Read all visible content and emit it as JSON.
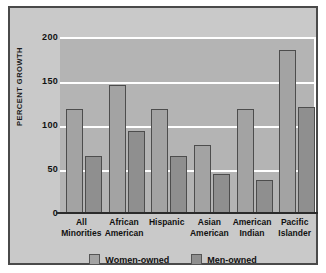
{
  "chart_data": {
    "type": "bar",
    "title": "",
    "subtitle": "",
    "xlabel": "",
    "ylabel": "PERCENT GROWTH",
    "ylim": [
      0,
      200
    ],
    "yticks": [
      0,
      50,
      100,
      150,
      200
    ],
    "grid": true,
    "legend_position": "bottom",
    "categories": [
      "All Minorities",
      "African American",
      "Hispanic",
      "Asian American",
      "American Indian",
      "Pacific Islander"
    ],
    "category_lines": [
      [
        "All",
        "Minorities"
      ],
      [
        "African",
        "American"
      ],
      [
        "Hispanic",
        ""
      ],
      [
        "Asian",
        "American"
      ],
      [
        "American",
        "Indian"
      ],
      [
        "Pacific",
        "Islander"
      ]
    ],
    "series": [
      {
        "name": "Women-owned",
        "color": "#a3a3a3",
        "values": [
          118,
          146,
          118,
          77,
          118,
          185
        ]
      },
      {
        "name": "Men-owned",
        "color": "#8f8f8f",
        "values": [
          65,
          93,
          65,
          44,
          37,
          120
        ]
      }
    ]
  },
  "legend": {
    "entries": [
      {
        "label": "Women-owned",
        "color": "#a3a3a3"
      },
      {
        "label": "Men-owned",
        "color": "#8f8f8f"
      }
    ]
  },
  "colors": {
    "frame_border": "#4a4a4a",
    "figure_background": "#c9c9c9",
    "plot_background": "#b4b4b4",
    "gridline": "#ffffff",
    "axis_line": "#2b2b2b",
    "text": "#111111"
  }
}
